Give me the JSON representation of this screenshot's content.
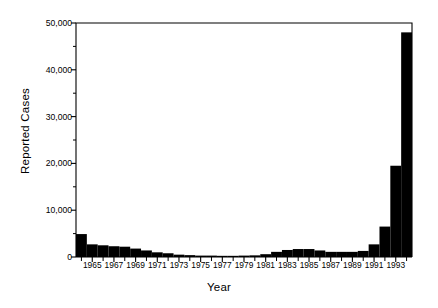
{
  "chart_data": {
    "type": "bar",
    "title": "",
    "xlabel": "Year",
    "ylabel": "Reported Cases",
    "ylim": [
      0,
      50000
    ],
    "xlim": [
      1963.5,
      1994.5
    ],
    "grid": false,
    "legend": null,
    "bar_color": "#000000",
    "background_color": "#ffffff",
    "axis_color": "#000000",
    "ytick_values": [
      0,
      10000,
      20000,
      30000,
      40000,
      50000
    ],
    "ytick_labels": [
      "0",
      "10,000",
      "20,000",
      "30,000",
      "40,000",
      "50,000"
    ],
    "yminor_interval": 5000,
    "xtick_labels": [
      "1965",
      "1967",
      "1969",
      "1971",
      "1973",
      "1975",
      "1977",
      "1979",
      "1981",
      "1983",
      "1985",
      "1987",
      "1989",
      "1991",
      "1993"
    ],
    "xtick_values": [
      1965,
      1967,
      1969,
      1971,
      1973,
      1975,
      1977,
      1979,
      1981,
      1983,
      1985,
      1987,
      1989,
      1991,
      1993
    ],
    "categories": [
      1964,
      1965,
      1966,
      1967,
      1968,
      1969,
      1970,
      1971,
      1972,
      1973,
      1974,
      1975,
      1976,
      1977,
      1978,
      1979,
      1980,
      1981,
      1982,
      1983,
      1984,
      1985,
      1986,
      1987,
      1988,
      1989,
      1990,
      1991,
      1992,
      1993,
      1994
    ],
    "values": [
      4900,
      2700,
      2500,
      2300,
      2200,
      1800,
      1400,
      1000,
      800,
      500,
      400,
      300,
      300,
      250,
      250,
      300,
      350,
      600,
      1100,
      1500,
      1700,
      1700,
      1400,
      1100,
      1100,
      1100,
      1300,
      2700,
      6500,
      19500,
      48000
    ]
  },
  "accessibility": {
    "description": "Bar chart of reported cases by year from 1964 to 1994 showing a decline through the 1970s and a sharp rise after 1990."
  }
}
